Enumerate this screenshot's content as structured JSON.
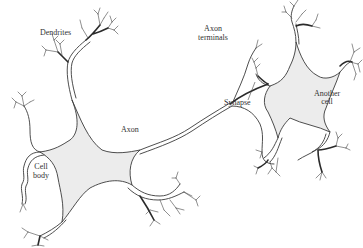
{
  "diagram": {
    "labels": {
      "dendrites": "Dendrites",
      "axon_terminals_line1": "Axon",
      "axon_terminals_line2": "terminals",
      "axon": "Axon",
      "synapse": "Synapse",
      "cell_body_line1": "Cell",
      "cell_body_line2": "body",
      "another_cell_line1": "Another",
      "another_cell_line2": "cell"
    },
    "colors": {
      "soma_fill": "#ececec",
      "line": "#3a3a3a",
      "background": "#ffffff"
    }
  }
}
